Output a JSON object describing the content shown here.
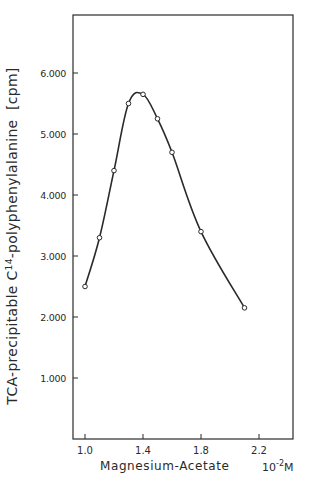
{
  "chart_data": {
    "type": "line",
    "title": "",
    "xlabel": "Magnesium-Acetate",
    "xunit_base": "10",
    "xunit_exp": "-2",
    "xunit_suffix": "M",
    "ylabel_prefix": "TCA-precipitable C",
    "ylabel_sup": "14",
    "ylabel_suffix": "-polyphenylalanine  [cpm]",
    "xlim": [
      0.9,
      2.4
    ],
    "ylim": [
      0,
      7200
    ],
    "xticks": [
      1.0,
      1.4,
      1.8,
      2.2
    ],
    "xtick_labels": [
      "1.0",
      "1.4",
      "1.8",
      "2.2"
    ],
    "yticks": [
      1000,
      2000,
      3000,
      4000,
      5000,
      6000
    ],
    "ytick_labels": [
      "1.000",
      "2.000",
      "3.000",
      "4.000",
      "5.000",
      "6.000"
    ],
    "grid": false,
    "legend": null,
    "series": [
      {
        "name": "TCA-precipitable C14-polyphenylalanine",
        "marker": "open-circle",
        "smooth": true,
        "x": [
          1.0,
          1.1,
          1.2,
          1.3,
          1.4,
          1.5,
          1.6,
          1.8,
          2.1
        ],
        "y": [
          2500,
          3300,
          4400,
          5500,
          5650,
          5250,
          4700,
          3400,
          2150
        ]
      }
    ]
  },
  "colors": {
    "ink": "#2a2a2a",
    "background": "#ffffff"
  }
}
